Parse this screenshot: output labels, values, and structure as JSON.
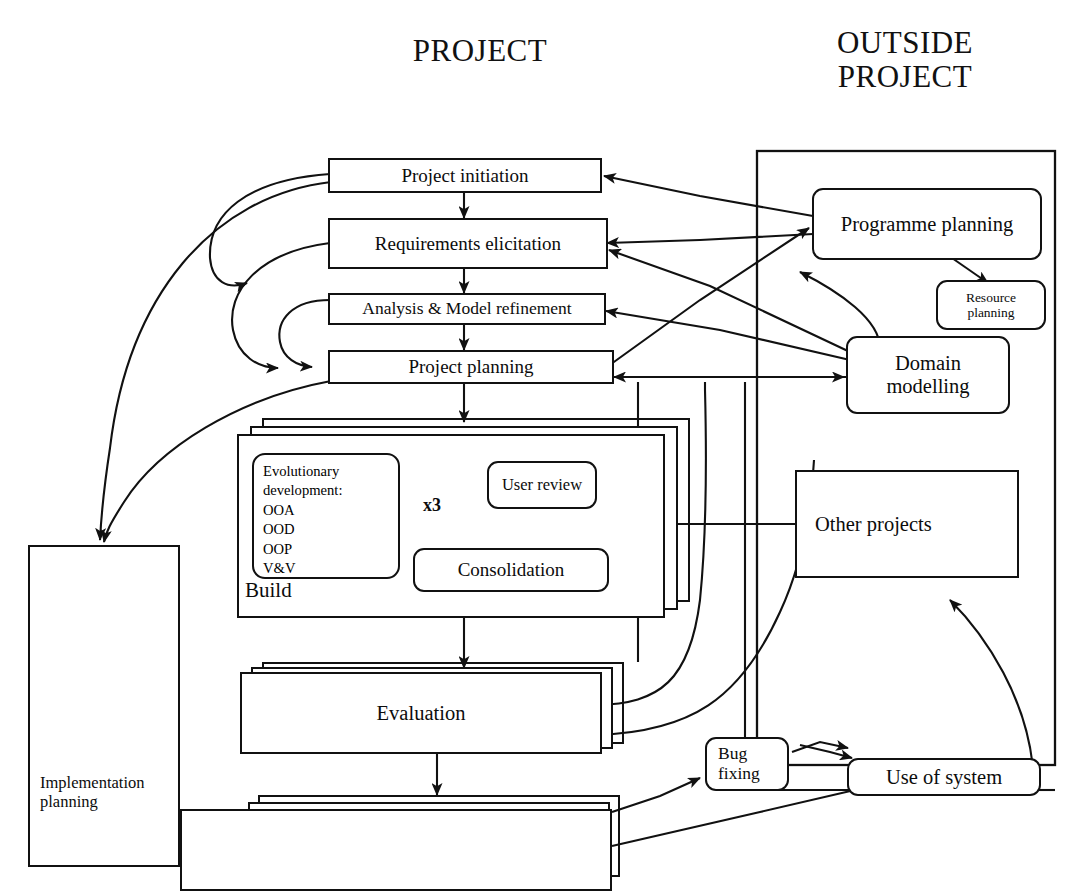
{
  "headers": {
    "left": "PROJECT",
    "right": "OUTSIDE\nPROJECT"
  },
  "project_nodes": [
    {
      "id": "project-initiation",
      "label": "Project initiation"
    },
    {
      "id": "requirements-elicitation",
      "label": "Requirements\nelicitation"
    },
    {
      "id": "analysis-model-refinement",
      "label": "Analysis & Model refinement"
    },
    {
      "id": "project-planning",
      "label": "Project planning"
    },
    {
      "id": "evaluation",
      "label": "Evaluation"
    },
    {
      "id": "implementation-planning",
      "label": "Implementation\nplanning"
    }
  ],
  "build": {
    "container_label": "Build",
    "evolutionary_development": "Evolutionary\ndevelopment:\nOOA\nOOD\nOOP\nV&V",
    "user_review": "User\nreview",
    "consolidation": "Consolidation",
    "iteration_label": "x3"
  },
  "outside_nodes": [
    {
      "id": "programme-planning",
      "label": "Programme\nplanning"
    },
    {
      "id": "resource-planning",
      "label": "Resource\nplanning"
    },
    {
      "id": "domain-modelling",
      "label": "Domain\nmodelling"
    },
    {
      "id": "other-projects",
      "label": "Other\nprojects"
    },
    {
      "id": "bug-fixing",
      "label": "Bug\nfixing"
    },
    {
      "id": "use-of-system",
      "label": "Use of system"
    }
  ],
  "colors": {
    "ink": "#111111",
    "paper": "#ffffff"
  }
}
